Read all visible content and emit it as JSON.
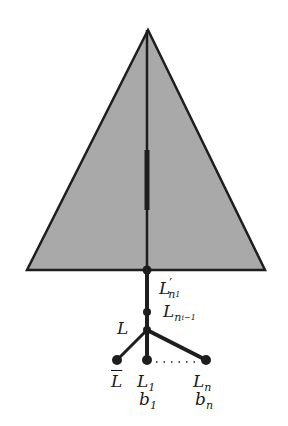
{
  "diagram": {
    "colors": {
      "triangle_fill": "#a9a9a9",
      "stroke": "#1e1e1e",
      "background": "#ffffff"
    },
    "triangle": {
      "apex": [
        148,
        30
      ],
      "base_left": [
        27,
        270
      ],
      "base_right": [
        265,
        270
      ]
    },
    "spine": {
      "x": 147,
      "y_top": 30,
      "y_bottom": 360
    },
    "thick_segment": {
      "x": 147,
      "y_from": 150,
      "y_to": 210
    },
    "nodes": [
      {
        "id": "base",
        "x": 147,
        "y": 270
      },
      {
        "id": "L_ni_minus_1",
        "x": 147,
        "y": 312
      },
      {
        "id": "L",
        "x": 147,
        "y": 330
      },
      {
        "id": "L_bar",
        "x": 117,
        "y": 360
      },
      {
        "id": "L_1",
        "x": 147,
        "y": 360
      },
      {
        "id": "L_n",
        "x": 206,
        "y": 360
      }
    ],
    "labels": {
      "L_prime_n1": {
        "base": "L",
        "prime": "′",
        "sub": "n",
        "subsub": "1"
      },
      "L_ni_minus_1": {
        "base": "L",
        "sub": "n",
        "subsub": "i−1"
      },
      "L": {
        "text": "L"
      },
      "L_bar": {
        "text": "L"
      },
      "L_1": {
        "base": "L",
        "sub": "1"
      },
      "b_1": {
        "base": "b",
        "sub": "1"
      },
      "L_n": {
        "base": "L",
        "sub": "n"
      },
      "b_n": {
        "base": "b",
        "sub": "n"
      },
      "ellipsis": "· · · · ·"
    }
  }
}
